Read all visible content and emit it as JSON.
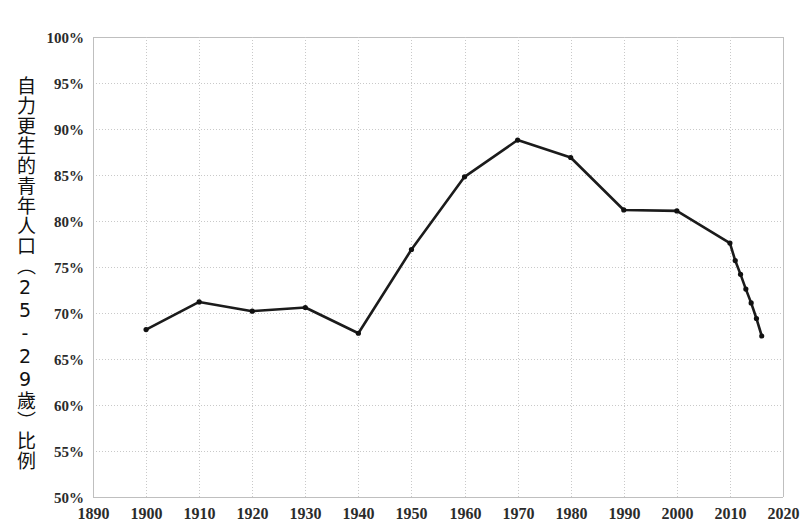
{
  "chart_data": {
    "type": "line",
    "title": "",
    "subtitle": "",
    "xlabel": "",
    "ylabel": "自力更生的青年人口（25-29歲）比例",
    "xlim": [
      1890,
      2020
    ],
    "ylim": [
      50,
      100
    ],
    "grid": true,
    "legend": null,
    "y_tick_format": "percent",
    "y_ticks": [
      {
        "value": 100,
        "label": "100%"
      },
      {
        "value": 95,
        "label": "95%"
      },
      {
        "value": 90,
        "label": "90%"
      },
      {
        "value": 85,
        "label": "85%"
      },
      {
        "value": 80,
        "label": "80%"
      },
      {
        "value": 75,
        "label": "75%"
      },
      {
        "value": 70,
        "label": "70%"
      },
      {
        "value": 65,
        "label": "65%"
      },
      {
        "value": 60,
        "label": "60%"
      },
      {
        "value": 55,
        "label": "55%"
      },
      {
        "value": 50,
        "label": "50%"
      }
    ],
    "x_ticks": [
      {
        "value": 1890,
        "label": "1890"
      },
      {
        "value": 1900,
        "label": "1900"
      },
      {
        "value": 1910,
        "label": "1910"
      },
      {
        "value": 1920,
        "label": "1920"
      },
      {
        "value": 1930,
        "label": "1930"
      },
      {
        "value": 1940,
        "label": "1940"
      },
      {
        "value": 1950,
        "label": "1950"
      },
      {
        "value": 1960,
        "label": "1960"
      },
      {
        "value": 1970,
        "label": "1970"
      },
      {
        "value": 1980,
        "label": "1980"
      },
      {
        "value": 1990,
        "label": "1990"
      },
      {
        "value": 2000,
        "label": "2000"
      },
      {
        "value": 2010,
        "label": "2010"
      },
      {
        "value": 2020,
        "label": "2020"
      }
    ],
    "series": [
      {
        "name": "自力更生的青年人口（25-29歲）比例",
        "color": "#1b1b1b",
        "marker": "dot",
        "x": [
          1900,
          1910,
          1920,
          1930,
          1940,
          1950,
          1960,
          1970,
          1980,
          1990,
          2000,
          2010,
          2011,
          2012,
          2013,
          2014,
          2015,
          2016
        ],
        "values": [
          68.2,
          71.2,
          70.2,
          70.6,
          67.8,
          76.9,
          84.8,
          88.8,
          86.9,
          81.2,
          81.1,
          77.6,
          75.7,
          74.2,
          72.6,
          71.1,
          69.4,
          67.5
        ]
      }
    ]
  },
  "axis": {
    "y_title": "自力更生的青年人口（25-29歲）比例"
  }
}
